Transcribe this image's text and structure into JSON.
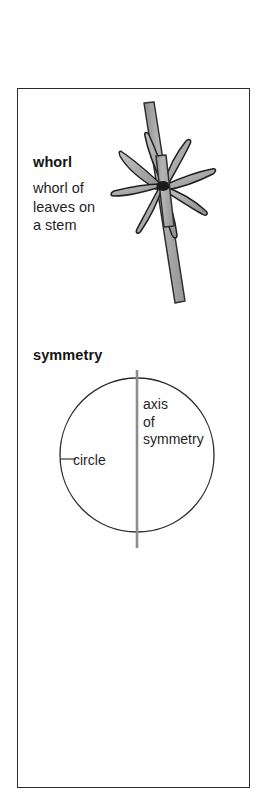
{
  "page": {
    "background_color": "#ffffff",
    "frame_color": "#2b2b2b"
  },
  "entries": [
    {
      "id": "whorl",
      "headword": "whorl",
      "gloss": "whorl of\nleaves on\na stem",
      "figure": {
        "name": "whorl-illustration",
        "description": "whorl of leaves on a stem",
        "fill_color": "#a9a9a9",
        "outline_color": "#1a1a1a",
        "leaf_count": 8
      }
    },
    {
      "id": "symmetry",
      "headword": "symmetry",
      "gloss": "",
      "figure": {
        "name": "symmetry-illustration",
        "description": "circle with vertical axis of symmetry",
        "axis_color": "#8d8d8d",
        "outline_color": "#2b2b2b",
        "labels": {
          "circle": "circle",
          "axis": "axis\nof\nsymmetry"
        }
      }
    }
  ]
}
